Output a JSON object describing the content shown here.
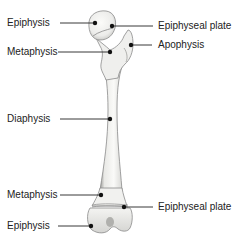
{
  "colors": {
    "bone_fill": "#f4f4f2",
    "bone_stroke": "#8a8a8a",
    "bone_shadow": "#c9c9c6",
    "leader_line": "#222222",
    "text": "#222222"
  },
  "labels": {
    "left": [
      {
        "id": "epiphysis-proximal",
        "text": "Epiphysis"
      },
      {
        "id": "metaphysis-proximal",
        "text": "Metaphysis"
      },
      {
        "id": "diaphysis",
        "text": "Diaphysis"
      },
      {
        "id": "metaphysis-distal",
        "text": "Metaphysis"
      },
      {
        "id": "epiphysis-distal",
        "text": "Epiphysis"
      }
    ],
    "right": [
      {
        "id": "epiphyseal-plate-proximal",
        "text": "Epiphyseal plate"
      },
      {
        "id": "apophysis",
        "text": "Apophysis"
      },
      {
        "id": "epiphyseal-plate-distal",
        "text": "Epiphyseal plate"
      }
    ]
  }
}
